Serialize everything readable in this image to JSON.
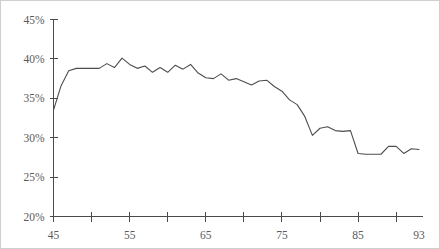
{
  "chart_data": {
    "type": "line",
    "title": "",
    "subtitle": "",
    "xlabel": "",
    "ylabel": "",
    "xlim": [
      45,
      93
    ],
    "ylim": [
      20,
      45
    ],
    "grid": false,
    "legend": null,
    "y_tick_labels": [
      "45%",
      "40%",
      "35%",
      "30%",
      "25%",
      "20%"
    ],
    "y_tick_values": [
      45,
      40,
      35,
      30,
      25,
      20
    ],
    "x_tick_values": [
      45,
      50,
      55,
      60,
      65,
      70,
      75,
      80,
      85,
      90
    ],
    "x_tick_labels": [
      "45",
      "",
      "55",
      "",
      "65",
      "",
      "75",
      "",
      "85",
      ""
    ],
    "x_labeled_ticks": [
      {
        "value": 45,
        "label": "45"
      },
      {
        "value": 55,
        "label": "55"
      },
      {
        "value": 65,
        "label": "65"
      },
      {
        "value": 75,
        "label": "75"
      },
      {
        "value": 85,
        "label": "85"
      },
      {
        "value": 93,
        "label": "93"
      }
    ],
    "series": [
      {
        "name": "series-1",
        "color": "#4d4d4d",
        "x": [
          45,
          46,
          47,
          48,
          49,
          50,
          51,
          52,
          53,
          54,
          55,
          56,
          57,
          58,
          59,
          60,
          61,
          62,
          63,
          64,
          65,
          66,
          67,
          68,
          69,
          70,
          71,
          72,
          73,
          74,
          75,
          76,
          77,
          78,
          79,
          80,
          81,
          82,
          83,
          84,
          85,
          86,
          87,
          88,
          89,
          90,
          91,
          92,
          93
        ],
        "values": [
          33.5,
          36.6,
          38.5,
          38.8,
          38.8,
          38.8,
          38.8,
          39.4,
          38.9,
          40.1,
          39.3,
          38.8,
          39.1,
          38.3,
          38.9,
          38.3,
          39.2,
          38.7,
          39.3,
          38.2,
          37.6,
          37.5,
          38.1,
          37.3,
          37.5,
          37.1,
          36.7,
          37.2,
          37.3,
          36.5,
          35.9,
          34.8,
          34.2,
          32.7,
          30.3,
          31.2,
          31.4,
          30.9,
          30.8,
          30.9,
          28.0,
          27.9,
          27.9,
          27.9,
          28.9,
          28.9,
          28.0,
          28.6,
          28.5
        ]
      }
    ],
    "note": "Single declining line series over x 45-93, peaking near 40% at x=54 and falling to about 23% at x=93."
  },
  "axis": {
    "y_axis_name": "y-axis",
    "x_axis_name": "x-axis"
  }
}
